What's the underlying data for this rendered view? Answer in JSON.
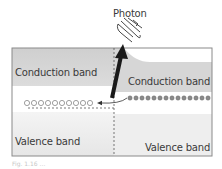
{
  "diagram": {
    "photon_label": "Photon",
    "left": {
      "conduction_label": "Conduction band",
      "valence_label": "Valence band",
      "hole_count": 10
    },
    "right": {
      "conduction_label": "Conduction band",
      "valence_label": "Valence band",
      "electron_count": 14
    },
    "caption": "Fig. 1.16 ..."
  },
  "colors": {
    "band_dark": "#d2d2d2",
    "band_light": "#ececec",
    "frame": "#8a8a8a",
    "arrow": "#1a1a1a",
    "text": "#3a3a3a"
  }
}
